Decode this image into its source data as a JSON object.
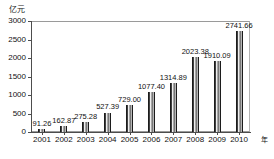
{
  "chart_data": {
    "type": "bar",
    "title": "",
    "subtitle": "",
    "unit_label": "亿元",
    "xlabel": "年",
    "ylabel": "",
    "categories": [
      "2001",
      "2002",
      "2003",
      "2004",
      "2005",
      "2006",
      "2007",
      "2008",
      "2009",
      "2010"
    ],
    "values": [
      91.26,
      162.87,
      275.28,
      527.39,
      729.0,
      1077.4,
      1314.89,
      2023.38,
      1910.09,
      2741.66
    ],
    "data_labels": [
      "91.26",
      "162.87",
      "275.28",
      "527.39",
      "729.00",
      "1077.40",
      "1314.89",
      "2023.38",
      "1910.09",
      "2741.66"
    ],
    "ylim": [
      0,
      3000
    ],
    "ytick_values": [
      0,
      500,
      1000,
      1500,
      2000,
      2500,
      3000
    ],
    "ytick_labels": [
      "0",
      "500",
      "1000",
      "1500",
      "2000",
      "2500",
      "3000"
    ],
    "grid": false,
    "legend": null,
    "bar_color": "#3a3a3a",
    "axis_color": "#4d4d4d",
    "frame_color": "#9a9a9a",
    "text_color": "#111111"
  }
}
